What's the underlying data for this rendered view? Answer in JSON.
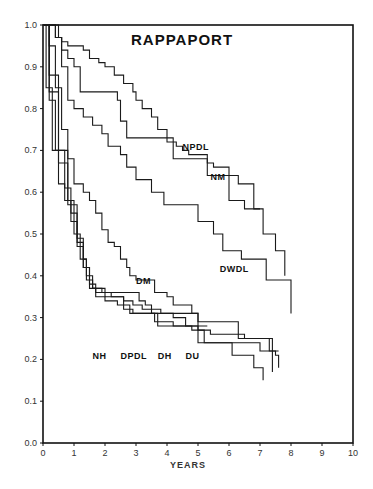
{
  "chart_data": {
    "type": "line",
    "title": "RAPPAPORT",
    "xlabel": "YEARS",
    "ylabel": "",
    "xlim": [
      0,
      10
    ],
    "ylim": [
      0,
      1.0
    ],
    "x_ticks": [
      "0",
      "1",
      "2",
      "3",
      "4",
      "5",
      "6",
      "7",
      "8",
      "9",
      "10"
    ],
    "y_ticks": [
      "0.0",
      "0.1",
      "0.2",
      "0.3",
      "0.4",
      "0.5",
      "0.6",
      "0.7",
      "0.8",
      "0.9",
      "1.0"
    ],
    "grid": false,
    "step": true,
    "series": [
      {
        "name": "NPDL",
        "points": [
          [
            0,
            1.0
          ],
          [
            0.3,
            1.0
          ],
          [
            0.4,
            0.97
          ],
          [
            0.6,
            0.96
          ],
          [
            0.8,
            0.95
          ],
          [
            1.3,
            0.94
          ],
          [
            1.5,
            0.92
          ],
          [
            1.8,
            0.91
          ],
          [
            2.0,
            0.9
          ],
          [
            2.3,
            0.88
          ],
          [
            2.6,
            0.86
          ],
          [
            2.9,
            0.84
          ],
          [
            3.0,
            0.82
          ],
          [
            3.2,
            0.8
          ],
          [
            3.5,
            0.78
          ],
          [
            3.7,
            0.75
          ],
          [
            4.0,
            0.72
          ],
          [
            4.3,
            0.71
          ],
          [
            4.5,
            0.7
          ],
          [
            4.7,
            0.69
          ],
          [
            5.2,
            0.69
          ],
          [
            5.3,
            0.67
          ],
          [
            5.5,
            0.66
          ],
          [
            6.0,
            0.64
          ],
          [
            6.3,
            0.62
          ],
          [
            6.8,
            0.56
          ],
          [
            7.0,
            0.56
          ],
          [
            7.1,
            0.5
          ],
          [
            7.5,
            0.5
          ],
          [
            7.5,
            0.46
          ],
          [
            7.8,
            0.46
          ],
          [
            7.8,
            0.4
          ]
        ]
      },
      {
        "name": "NM",
        "points": [
          [
            0,
            1.0
          ],
          [
            0.5,
            0.97
          ],
          [
            0.6,
            0.94
          ],
          [
            0.8,
            0.92
          ],
          [
            1.0,
            0.9
          ],
          [
            1.2,
            0.84
          ],
          [
            2.3,
            0.84
          ],
          [
            2.4,
            0.82
          ],
          [
            2.5,
            0.77
          ],
          [
            2.7,
            0.73
          ],
          [
            4.1,
            0.73
          ],
          [
            4.2,
            0.68
          ],
          [
            5.2,
            0.68
          ],
          [
            5.3,
            0.64
          ],
          [
            6.0,
            0.64
          ],
          [
            6.0,
            0.58
          ],
          [
            6.5,
            0.58
          ],
          [
            6.5,
            0.56
          ],
          [
            7.0,
            0.56
          ]
        ]
      },
      {
        "name": "DWDL",
        "points": [
          [
            0,
            1.0
          ],
          [
            0.4,
            0.97
          ],
          [
            0.6,
            0.9
          ],
          [
            0.8,
            0.82
          ],
          [
            1.0,
            0.8
          ],
          [
            1.3,
            0.78
          ],
          [
            1.6,
            0.76
          ],
          [
            1.9,
            0.74
          ],
          [
            2.1,
            0.71
          ],
          [
            2.5,
            0.69
          ],
          [
            2.7,
            0.66
          ],
          [
            3.0,
            0.63
          ],
          [
            3.5,
            0.6
          ],
          [
            3.9,
            0.57
          ],
          [
            4.9,
            0.57
          ],
          [
            5.0,
            0.53
          ],
          [
            5.5,
            0.5
          ],
          [
            5.8,
            0.46
          ],
          [
            6.4,
            0.46
          ],
          [
            6.4,
            0.44
          ],
          [
            7.0,
            0.44
          ],
          [
            7.2,
            0.39
          ],
          [
            8.0,
            0.39
          ],
          [
            8.0,
            0.31
          ]
        ]
      },
      {
        "name": "DM",
        "points": [
          [
            0,
            1.0
          ],
          [
            0.2,
            0.95
          ],
          [
            0.4,
            0.85
          ],
          [
            0.6,
            0.75
          ],
          [
            0.8,
            0.68
          ],
          [
            1.0,
            0.62
          ],
          [
            1.3,
            0.6
          ],
          [
            1.5,
            0.58
          ],
          [
            1.7,
            0.55
          ],
          [
            1.9,
            0.51
          ],
          [
            2.1,
            0.48
          ],
          [
            2.3,
            0.47
          ],
          [
            2.5,
            0.44
          ],
          [
            2.7,
            0.42
          ],
          [
            2.8,
            0.4
          ],
          [
            3.0,
            0.39
          ],
          [
            3.5,
            0.39
          ],
          [
            3.6,
            0.36
          ],
          [
            4.0,
            0.35
          ],
          [
            4.2,
            0.33
          ],
          [
            4.8,
            0.31
          ],
          [
            5.0,
            0.29
          ],
          [
            6.3,
            0.29
          ],
          [
            6.3,
            0.25
          ],
          [
            7.3,
            0.25
          ],
          [
            7.4,
            0.17
          ]
        ]
      },
      {
        "name": "NH",
        "points": [
          [
            0,
            1.0
          ],
          [
            0.1,
            0.85
          ],
          [
            0.3,
            0.7
          ],
          [
            0.5,
            0.62
          ],
          [
            0.7,
            0.58
          ],
          [
            0.9,
            0.53
          ],
          [
            1.1,
            0.47
          ],
          [
            1.3,
            0.42
          ],
          [
            1.5,
            0.38
          ],
          [
            1.7,
            0.36
          ],
          [
            3.0,
            0.36
          ],
          [
            3.1,
            0.34
          ],
          [
            3.3,
            0.33
          ],
          [
            3.5,
            0.31
          ],
          [
            4.7,
            0.31
          ],
          [
            5.0,
            0.24
          ],
          [
            6.1,
            0.24
          ],
          [
            6.1,
            0.21
          ],
          [
            6.6,
            0.21
          ],
          [
            6.8,
            0.18
          ],
          [
            7.1,
            0.18
          ],
          [
            7.1,
            0.15
          ]
        ]
      },
      {
        "name": "DPDL",
        "points": [
          [
            0,
            1.0
          ],
          [
            0.2,
            0.82
          ],
          [
            0.4,
            0.7
          ],
          [
            0.7,
            0.61
          ],
          [
            0.9,
            0.55
          ],
          [
            1.1,
            0.49
          ],
          [
            1.3,
            0.44
          ],
          [
            1.4,
            0.39
          ],
          [
            1.6,
            0.37
          ],
          [
            1.9,
            0.36
          ],
          [
            2.2,
            0.35
          ],
          [
            2.6,
            0.34
          ],
          [
            2.9,
            0.33
          ],
          [
            3.2,
            0.32
          ],
          [
            3.5,
            0.32
          ],
          [
            3.8,
            0.31
          ],
          [
            4.2,
            0.3
          ],
          [
            4.6,
            0.28
          ],
          [
            5.0,
            0.27
          ],
          [
            5.4,
            0.26
          ],
          [
            6.1,
            0.26
          ],
          [
            6.5,
            0.25
          ],
          [
            7.3,
            0.22
          ],
          [
            7.5,
            0.21
          ],
          [
            7.6,
            0.21
          ],
          [
            7.6,
            0.18
          ]
        ]
      },
      {
        "name": "DH",
        "points": [
          [
            0,
            1.0
          ],
          [
            0.2,
            0.84
          ],
          [
            0.5,
            0.67
          ],
          [
            0.8,
            0.57
          ],
          [
            1.1,
            0.48
          ],
          [
            1.3,
            0.42
          ],
          [
            1.5,
            0.37
          ],
          [
            1.7,
            0.35
          ],
          [
            2.0,
            0.34
          ],
          [
            2.4,
            0.33
          ],
          [
            2.8,
            0.31
          ],
          [
            3.3,
            0.31
          ],
          [
            3.6,
            0.29
          ],
          [
            4.2,
            0.28
          ],
          [
            4.8,
            0.27
          ],
          [
            5.2,
            0.24
          ],
          [
            5.3,
            0.24
          ],
          [
            5.3,
            0.24
          ],
          [
            7.0,
            0.22
          ],
          [
            7.6,
            0.22
          ]
        ]
      },
      {
        "name": "DU",
        "points": [
          [
            0,
            1.0
          ],
          [
            0.2,
            0.88
          ],
          [
            0.5,
            0.7
          ],
          [
            0.8,
            0.58
          ],
          [
            1.0,
            0.5
          ],
          [
            1.2,
            0.44
          ],
          [
            1.4,
            0.4
          ],
          [
            1.6,
            0.37
          ],
          [
            2.0,
            0.35
          ],
          [
            2.6,
            0.32
          ],
          [
            2.9,
            0.31
          ],
          [
            3.3,
            0.31
          ],
          [
            3.7,
            0.28
          ],
          [
            5.3,
            0.28
          ]
        ]
      }
    ],
    "annotations": [
      {
        "text": "NPDL",
        "x": 4.5,
        "y": 0.7
      },
      {
        "text": "NM",
        "x": 5.4,
        "y": 0.63
      },
      {
        "text": "DWDL",
        "x": 5.7,
        "y": 0.41
      },
      {
        "text": "DM",
        "x": 3.0,
        "y": 0.38
      },
      {
        "text": "NH",
        "x": 1.6,
        "y": 0.2
      },
      {
        "text": "DPDL",
        "x": 2.5,
        "y": 0.2
      },
      {
        "text": "DH",
        "x": 3.7,
        "y": 0.2
      },
      {
        "text": "DU",
        "x": 4.6,
        "y": 0.2
      }
    ]
  }
}
